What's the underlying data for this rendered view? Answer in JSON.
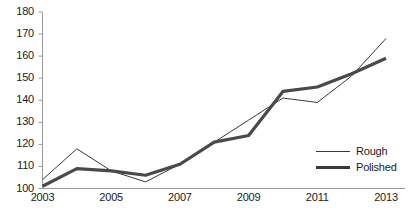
{
  "chart_data": {
    "type": "line",
    "title": "",
    "subtitle": "",
    "xlabel": "",
    "ylabel": "",
    "x": [
      2003,
      2004,
      2005,
      2006,
      2007,
      2008,
      2009,
      2010,
      2011,
      2012,
      2013
    ],
    "x_tick_labels": [
      "2003",
      "2005",
      "2007",
      "2009",
      "2011",
      "2013"
    ],
    "x_tick_values": [
      2003,
      2005,
      2007,
      2009,
      2011,
      2013
    ],
    "y_tick_labels": [
      "100",
      "110",
      "120",
      "130",
      "140",
      "150",
      "160",
      "170",
      "180"
    ],
    "y_tick_values": [
      100,
      110,
      120,
      130,
      140,
      150,
      160,
      170,
      180
    ],
    "xlim": [
      2003,
      2013
    ],
    "ylim": [
      100,
      180
    ],
    "grid": false,
    "legend_position": "right-inside",
    "series": [
      {
        "name": "Rough",
        "style": "thin",
        "color": "#3a3a3a",
        "values": [
          104,
          118,
          108,
          103,
          111,
          121,
          131,
          141,
          139,
          151,
          168
        ]
      },
      {
        "name": "Polished",
        "style": "thick",
        "color": "#4a4a4a",
        "values": [
          101,
          109,
          108,
          106,
          111,
          121,
          124,
          144,
          146,
          152,
          159
        ]
      }
    ]
  },
  "legend": {
    "items": [
      {
        "label": "Rough"
      },
      {
        "label": "Polished"
      }
    ]
  },
  "axes": {
    "axis_color": "#9a9a9a",
    "tick_color": "#9a9a9a",
    "text_color": "#1a1a1a"
  }
}
